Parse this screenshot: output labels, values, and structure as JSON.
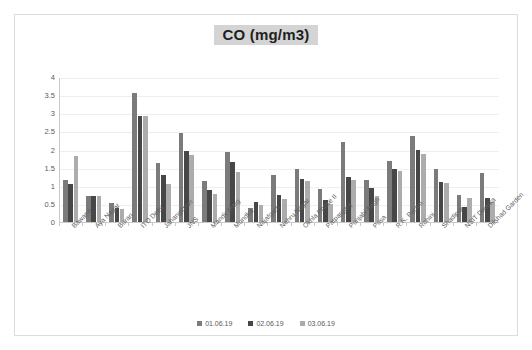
{
  "chart_data": {
    "type": "bar",
    "title": "CO (mg/m3)",
    "xlabel": "",
    "ylabel": "",
    "ylim": [
      0,
      4
    ],
    "yticks": [
      "0",
      "0.5",
      "1",
      "1.5",
      "2",
      "2.5",
      "3",
      "3.5",
      "4"
    ],
    "grid": true,
    "legend_position": "bottom",
    "categories": [
      "Bawana",
      "Aya Nagar",
      "Burari",
      "ITO Delhi",
      "Jahangirpuri",
      "JNS",
      "Mandir Marg",
      "Mundka",
      "Najafgarh",
      "Nehru Nagar",
      "Okhla Phase II",
      "Patparganj",
      "Punjabi Bagh",
      "Pusa",
      "R.K. Puram",
      "Rohini",
      "Shadipur",
      "NSIT Dwarka",
      "Dilshad Garden"
    ],
    "series": [
      {
        "name": "01.06.19",
        "color": "#7b7b7b",
        "values": [
          1.2,
          0.75,
          0.55,
          3.6,
          1.65,
          2.47,
          1.15,
          1.95,
          0.42,
          1.33,
          1.48,
          0.93,
          2.23,
          1.2,
          1.72,
          2.4,
          1.48,
          0.78,
          1.38
        ]
      },
      {
        "name": "02.06.19",
        "color": "#474747",
        "values": [
          1.08,
          0.75,
          0.42,
          2.95,
          1.32,
          2.0,
          0.9,
          1.67,
          0.58,
          0.78,
          1.22,
          0.63,
          1.27,
          0.97,
          1.48,
          2.02,
          1.13,
          0.43,
          0.7
        ]
      },
      {
        "name": "03.06.19",
        "color": "#acacac",
        "values": [
          1.85,
          0.75,
          0.38,
          2.95,
          1.08,
          1.88,
          0.8,
          1.42,
          0.5,
          0.67,
          1.15,
          0.52,
          1.18,
          0.74,
          1.43,
          1.9,
          1.1,
          0.7,
          0.58
        ]
      }
    ]
  }
}
